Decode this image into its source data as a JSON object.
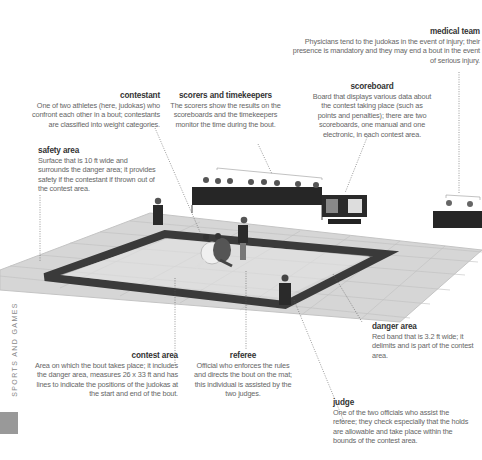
{
  "section": "SPORTS AND GAMES",
  "colors": {
    "mat": "#d4d4d4",
    "mat_lines": "#bdbdbd",
    "danger_band": "#3a3a3a",
    "tab_block": "#999999"
  },
  "labels": {
    "medical_team": {
      "title": "medical team",
      "text": "Physicians tend to the judokas in the event of injury; their presence is mandatory and they may end a bout in the event of serious injury."
    },
    "contestant": {
      "title": "contestant",
      "text": "One of two athletes (here, judokas) who confront each other in a bout; contestants are classified into weight categories."
    },
    "scorers": {
      "title": "scorers and timekeepers",
      "text": "The scorers show the results on the scoreboards and the timekeepers monitor the time during the bout."
    },
    "scoreboard": {
      "title": "scoreboard",
      "text": "Board that displays various data about the contest taking place (such as points and penalties); there are two scoreboards, one manual and one electronic, in each contest area."
    },
    "safety_area": {
      "title": "safety area",
      "text": "Surface that is 10 ft wide and surrounds the danger area; it provides safety if the contestant if thrown out of the contest area."
    },
    "contest_area": {
      "title": "contest area",
      "text": "Area on which the bout takes place; it includes the danger area, measures 26 x 33 ft and has lines to indicate the positions of the judokas at the start and end of the bout."
    },
    "referee": {
      "title": "referee",
      "text": "Official who enforces the rules and directs the bout on the mat; this individual is assisted by the two judges."
    },
    "danger_area": {
      "title": "danger area",
      "text": "Red band that is 3.2 ft wide; it delimits and is part of the contest area."
    },
    "judge": {
      "title": "judge",
      "text": "One of the two officials who assist the referee; they check especially that the holds are allowable and take place within the bounds of the contest area."
    }
  }
}
